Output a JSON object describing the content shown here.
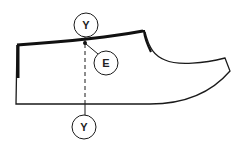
{
  "diagram": {
    "type": "shoe-pattern-outline",
    "colors": {
      "line": "#1a1a1a",
      "background": "#ffffff"
    },
    "labels": {
      "top_marker": "Y",
      "bottom_marker": "Y",
      "point_marker": "E"
    }
  }
}
